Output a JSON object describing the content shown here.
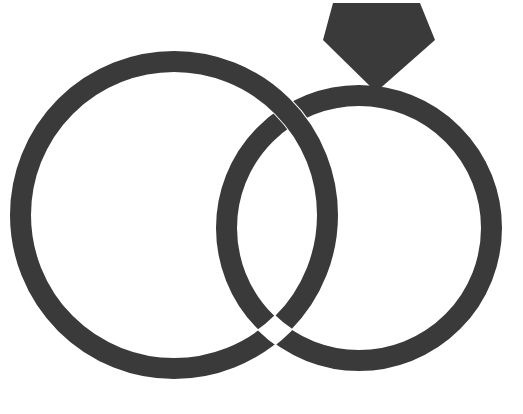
{
  "image": {
    "title": "Interlocking Wedding Rings",
    "subject": "wedding-rings",
    "background_color": "#ffffff",
    "ink_color": "#3a3a3a",
    "width": 523,
    "height": 414,
    "style": "flat monochrome line illustration"
  },
  "elements": {
    "left_ring": {
      "label": "Plain wedding band",
      "center_x": 174,
      "center_y": 215,
      "outer_radius": 164,
      "stroke_width": 21,
      "color": "#3a3a3a"
    },
    "right_ring": {
      "label": "Engagement ring band",
      "center_x": 359,
      "center_y": 228,
      "outer_radius": 143,
      "stroke_width": 21,
      "color": "#3a3a3a"
    },
    "diamond": {
      "label": "Diamond solitaire gem",
      "color": "#3a3a3a",
      "points": "333,3 420,3 435,40 376,92 323,40",
      "top_left_x": 333,
      "top_right_x": 420,
      "top_y": 3,
      "left_vertex_x": 323,
      "right_vertex_x": 435,
      "shoulder_y": 40,
      "tip_x": 376,
      "tip_y": 92
    },
    "overlap": {
      "label": "Interlocking crossing point",
      "upper_intersection_x": 282,
      "upper_intersection_y": 105,
      "lower_intersection_x": 295,
      "lower_intersection_y": 345
    }
  }
}
